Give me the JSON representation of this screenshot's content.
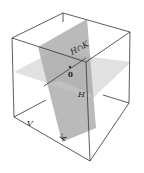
{
  "figure": {
    "type": "3d-subspace-diagram",
    "labels": {
      "intersection": "H∩K",
      "origin": "0",
      "plane_h": "H",
      "plane_k": "K",
      "space": "V"
    }
  },
  "colors": {
    "edge": "#333333",
    "plane_h": "#d9d9d9",
    "plane_k": "#a8a8a8",
    "background": "#ffffff"
  }
}
